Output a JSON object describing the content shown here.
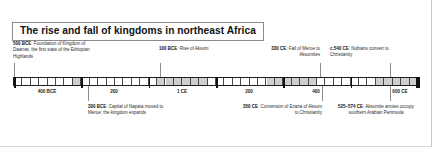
{
  "figure": {
    "title": "The rise and fall of kingdoms in northeast Africa"
  },
  "axis": {
    "start_year": -600,
    "end_year": 600,
    "tick_labels": [
      {
        "text": "400 BCE",
        "year": -400
      },
      {
        "text": "200",
        "year": -200
      },
      {
        "text": "1 CE",
        "year": 1
      },
      {
        "text": "200",
        "year": 200
      },
      {
        "text": "400",
        "year": 400
      },
      {
        "text": "600 CE",
        "year": 600
      }
    ]
  },
  "events": {
    "above": [
      {
        "lead": "500 BCE",
        "body": ": Foundation of Kingdom of Daamat, the first state of the Ethiopian Highlands",
        "year": -500
      },
      {
        "lead": "100 BCE",
        "body": ": Rise of Aksum",
        "year": -100
      },
      {
        "lead": "330 CE",
        "body": ": Fall of Meroe to Aksumites",
        "year": 330
      },
      {
        "lead": "c.540 CE",
        "body": ": Nubians convert to Christianity",
        "year": 540
      }
    ],
    "below": [
      {
        "lead": "300 BCE",
        "body": ": Capital of Napata moved to Meroe; the kingdom expands",
        "year": -300
      },
      {
        "lead": "350 CE",
        "body": ": Conversion of Ezana of Aksum to Christianity",
        "year": 350
      },
      {
        "lead": "525–574 CE",
        "body": ": Aksumite armies occupy southern Arabian Peninsula",
        "year": 550
      }
    ]
  },
  "chart_data": {
    "type": "timeline",
    "title": "The rise and fall of kingdoms in northeast Africa",
    "xlabel": "",
    "ylabel": "",
    "xlim": [
      -600,
      600
    ],
    "grid": false,
    "tick_values": [
      -400,
      -200,
      1,
      200,
      400,
      600
    ],
    "tick_text": [
      "400 BCE",
      "200",
      "1 CE",
      "200",
      "400",
      "600 CE"
    ],
    "minor_tick_interval": 25,
    "events": [
      {
        "year": -500,
        "label": "500 BCE: Foundation of Kingdom of Daamat, the first state of the Ethiopian Highlands",
        "side": "above"
      },
      {
        "year": -300,
        "label": "300 BCE: Capital of Napata moved to Meroe; the kingdom expands",
        "side": "below"
      },
      {
        "year": -100,
        "label": "100 BCE: Rise of Aksum",
        "side": "above"
      },
      {
        "year": 330,
        "label": "330 CE: Fall of Meroe to Aksumites",
        "side": "above"
      },
      {
        "year": 350,
        "label": "350 CE: Conversion of Ezana of Aksum to Christianity",
        "side": "below"
      },
      {
        "year": 540,
        "label": "c.540 CE: Nubians convert to Christianity",
        "side": "above"
      },
      {
        "year": 550,
        "label": "525–574 CE: Aksumite armies occupy southern Arabian Peninsula",
        "side": "below"
      }
    ]
  }
}
